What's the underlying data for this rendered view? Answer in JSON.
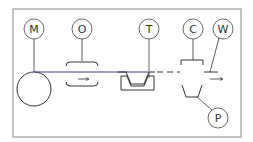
{
  "diagram": {
    "type": "process-schematic",
    "labels": {
      "M": "M",
      "O": "O",
      "T": "T",
      "C": "C",
      "W": "W",
      "P": "P"
    },
    "colors": {
      "line": "#333333",
      "frame": "#888888",
      "web": "#3a3a7a"
    }
  }
}
